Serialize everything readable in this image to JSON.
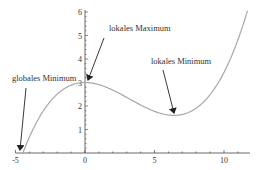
{
  "chart_data": {
    "type": "line",
    "title": "",
    "xlabel": "",
    "ylabel": "",
    "xlim": [
      -5,
      12
    ],
    "ylim": [
      0,
      6
    ],
    "grid": false,
    "legend": null,
    "x_ticks": [
      -5,
      0,
      5,
      10
    ],
    "y_ticks": [
      1,
      2,
      3,
      4,
      5,
      6
    ],
    "function": "f(x) = 0.01068 x^3 - 0.1025 x^2 + 3",
    "series": [
      {
        "name": "f(x)",
        "x": [
          -4.5,
          -4,
          -3,
          -2,
          -1,
          0,
          1,
          2,
          3,
          4,
          5,
          6,
          6.4,
          7,
          8,
          9,
          10,
          11,
          11.7
        ],
        "values": [
          -0.05,
          0.68,
          1.79,
          2.5,
          2.89,
          3.0,
          2.91,
          2.68,
          2.37,
          2.04,
          1.77,
          1.62,
          1.6,
          1.64,
          1.91,
          2.48,
          3.44,
          4.81,
          6.0
        ]
      }
    ],
    "annotations": [
      {
        "label": "globales Minimum",
        "point": [
          -4.5,
          0
        ],
        "text_pos": [
          12,
          79
        ]
      },
      {
        "label": "lokales Maximum",
        "point": [
          0,
          3
        ],
        "text_pos": [
          110,
          28
        ]
      },
      {
        "label": "lokales Minimum",
        "point": [
          6.4,
          1.6
        ],
        "text_pos": [
          152,
          61
        ]
      }
    ]
  },
  "labels": {
    "global_min": "globales Minimum",
    "local_max": "lokales Maximum",
    "local_min": "lokales Minimum"
  },
  "colors": {
    "curve": "#a8a8a8",
    "axis": "#444444",
    "text": "#333333",
    "arrow": "#222222"
  }
}
